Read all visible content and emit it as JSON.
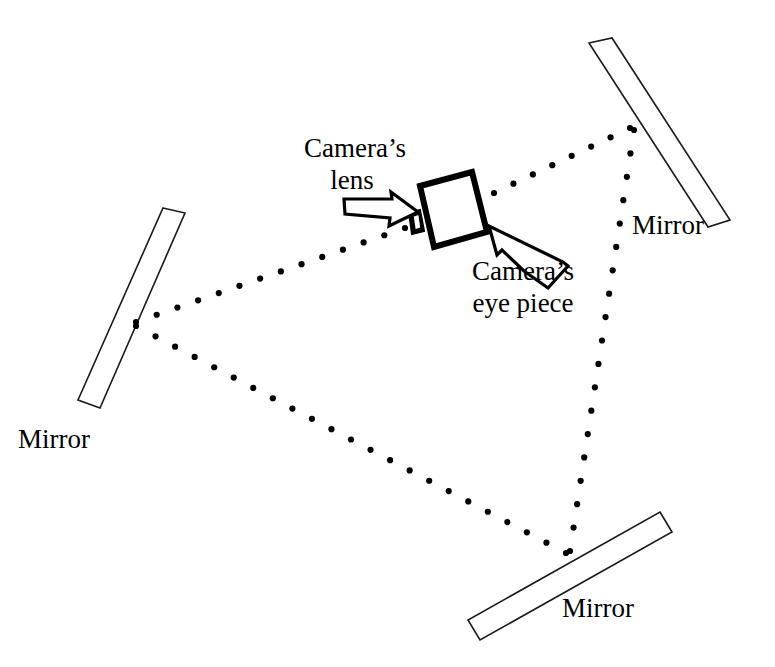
{
  "figure": {
    "background_color": "#ffffff",
    "ink_color": "#000000",
    "width": 775,
    "height": 667
  },
  "labels": {
    "camera_lens_line1": "Camera’s",
    "camera_lens_line2": "lens",
    "camera_eyepiece_line1": "Camera’s",
    "camera_eyepiece_line2": "eye piece",
    "mirror_top_right": "Mirror",
    "mirror_left": "Mirror",
    "mirror_bottom": "Mirror"
  },
  "mirrors": [
    {
      "name": "mirror-top-right",
      "label": "Mirror",
      "points": "589,43 612,38 730,220 708,227",
      "label_x": 632,
      "label_y": 234
    },
    {
      "name": "mirror-left",
      "label": "Mirror",
      "points": "163,208 185,213 100,408 78,400",
      "label_x": 18,
      "label_y": 448
    },
    {
      "name": "mirror-bottom",
      "label": "Mirror",
      "points": "660,512 672,532 480,640 468,620",
      "label_x": 562,
      "label_y": 617
    }
  ],
  "camera": {
    "name": "camera",
    "body_points": "420,186 472,172 487,232 434,247",
    "lens_block_points": "409,213 420,210 424,231 412,234",
    "lens_inner_points": "413,216 419,214 421,228 415,230"
  },
  "rays": [
    {
      "name": "ray-camera-lens-to-left-mirror",
      "from": [
        405,
        228
      ],
      "to": [
        136,
        322
      ],
      "dot_count": 13
    },
    {
      "name": "ray-left-mirror-to-bottom-mirror",
      "from": [
        136,
        326
      ],
      "to": [
        566,
        553
      ],
      "dot_count": 22
    },
    {
      "name": "ray-bottom-mirror-to-top-right-mirror",
      "from": [
        570,
        551
      ],
      "to": [
        634,
        130
      ],
      "dot_count": 18
    },
    {
      "name": "ray-top-right-mirror-to-camera",
      "from": [
        630,
        128
      ],
      "to": [
        494,
        193
      ],
      "dot_count": 7
    }
  ],
  "arrows": [
    {
      "name": "arrow-camera-lens",
      "outline": "344,199 392,199 391,192 418,212 389,226 390,218 345,214",
      "points_to": "camera-lens"
    },
    {
      "name": "arrow-camera-eyepiece",
      "outline": "548,288 568,266 563,262 489,226 497,255 502,250 524,271"
    }
  ],
  "label_positions": {
    "camera_lens": {
      "x": 355,
      "y": 157,
      "x2": 348,
      "y2": 189
    },
    "camera_eyepiece": {
      "x": 522,
      "y": 280,
      "x2": 522,
      "y2": 312
    }
  }
}
